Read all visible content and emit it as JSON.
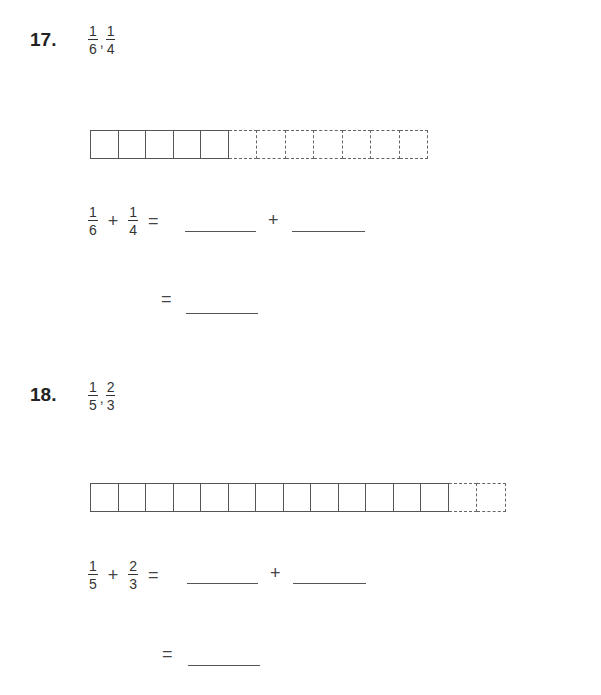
{
  "problems": [
    {
      "number": "17.",
      "fractions": [
        {
          "num": "1",
          "den": "6"
        },
        {
          "num": "1",
          "den": "4"
        }
      ],
      "bar": {
        "solid": 5,
        "dashed": 7
      },
      "equation": {
        "plus": "+",
        "equals": "="
      }
    },
    {
      "number": "18.",
      "fractions": [
        {
          "num": "1",
          "den": "5"
        },
        {
          "num": "2",
          "den": "3"
        }
      ],
      "bar": {
        "solid": 13,
        "dashed": 2
      },
      "equation": {
        "plus": "+",
        "equals": "="
      }
    }
  ],
  "separator": ","
}
